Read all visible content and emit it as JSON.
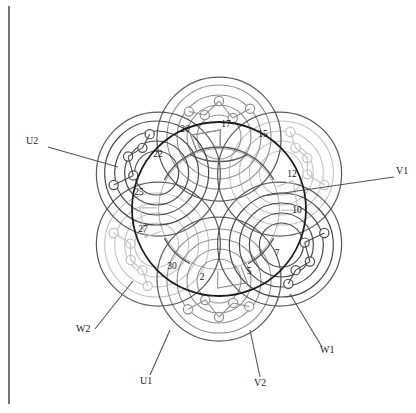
{
  "figure": {
    "kind": "stator-winding-diagram",
    "center": {
      "x": 219,
      "y": 209
    },
    "stator_outer_radius": 87,
    "stator_bore_radius": 62,
    "border": {
      "color": "#3a3a3a",
      "x": 9,
      "y_top": 6,
      "y_bottom": 404
    }
  },
  "colors": {
    "phase_u": "#4a4a4a",
    "phase_v": "#8f8f8f",
    "phase_w": "#c2c2c2",
    "stator_ring": "#1e1e1e",
    "bore_ring": "#5a5a5a",
    "label_text": "#1a1a1a",
    "slot_text": "#111111",
    "leader": "#555555",
    "node_fill": "#ffffff",
    "background": "#ffffff"
  },
  "slot_numbers": [
    {
      "label": "17",
      "x": 226,
      "y": 124
    },
    {
      "label": "20",
      "x": 185,
      "y": 129
    },
    {
      "label": "15",
      "x": 263,
      "y": 134
    },
    {
      "label": "22",
      "x": 158,
      "y": 154
    },
    {
      "label": "12",
      "x": 292,
      "y": 174
    },
    {
      "label": "25",
      "x": 139,
      "y": 192
    },
    {
      "label": "10",
      "x": 297,
      "y": 210
    },
    {
      "label": "27",
      "x": 143,
      "y": 229
    },
    {
      "label": "7",
      "x": 277,
      "y": 253
    },
    {
      "label": "30",
      "x": 172,
      "y": 266
    },
    {
      "label": "5",
      "x": 249,
      "y": 271
    },
    {
      "label": "2",
      "x": 202,
      "y": 277
    }
  ],
  "terminals": [
    {
      "id": "U2",
      "label": "U2",
      "text_x": 26,
      "text_y": 141,
      "leader": [
        [
          48,
          147
        ],
        [
          118,
          167
        ]
      ]
    },
    {
      "id": "V1",
      "label": "V1",
      "text_x": 396,
      "text_y": 171,
      "leader": [
        [
          394,
          177
        ],
        [
          263,
          196
        ]
      ]
    },
    {
      "id": "W2",
      "label": "W2",
      "text_x": 76,
      "text_y": 329,
      "leader": [
        [
          95,
          329
        ],
        [
          133,
          281
        ]
      ]
    },
    {
      "id": "W1",
      "label": "W1",
      "text_x": 320,
      "text_y": 350,
      "leader": [
        [
          322,
          347
        ],
        [
          290,
          294
        ]
      ]
    },
    {
      "id": "U1",
      "label": "U1",
      "text_x": 140,
      "text_y": 381,
      "leader": [
        [
          150,
          375
        ],
        [
          170,
          330
        ]
      ]
    },
    {
      "id": "V2",
      "label": "V2",
      "text_x": 254,
      "text_y": 383,
      "leader": [
        [
          260,
          377
        ],
        [
          250,
          330
        ]
      ]
    }
  ],
  "phases": [
    {
      "name": "U",
      "color_key": "phase_u",
      "terminals": [
        "U1",
        "U2"
      ]
    },
    {
      "name": "V",
      "color_key": "phase_v",
      "terminals": [
        "V1",
        "V2"
      ]
    },
    {
      "name": "W",
      "color_key": "phase_w",
      "terminals": [
        "W1",
        "W2"
      ]
    }
  ],
  "coil_groups": {
    "count": 6,
    "petal_radius": 86,
    "petal_center_radius": 72,
    "node_radius": 4.6
  },
  "chart_data": {
    "type": "diagram",
    "title": "",
    "categories": [
      "17",
      "20",
      "15",
      "22",
      "12",
      "25",
      "10",
      "27",
      "7",
      "30",
      "5",
      "2"
    ],
    "values": [
      17,
      20,
      15,
      22,
      12,
      25,
      10,
      27,
      7,
      30,
      5,
      2
    ],
    "series": [
      {
        "name": "Phase U",
        "terminals": [
          "U1",
          "U2"
        ]
      },
      {
        "name": "Phase V",
        "terminals": [
          "V1",
          "V2"
        ]
      },
      {
        "name": "Phase W",
        "terminals": [
          "W1",
          "W2"
        ]
      }
    ],
    "xlabel": "",
    "ylabel": "",
    "grid": false,
    "legend": "none"
  }
}
